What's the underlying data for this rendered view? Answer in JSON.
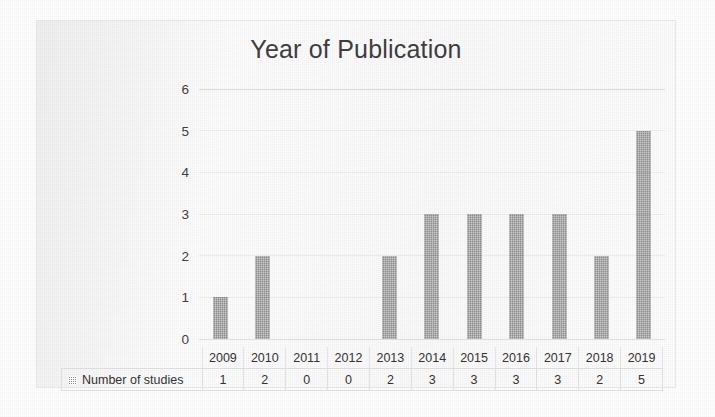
{
  "chart_data": {
    "type": "bar",
    "title": "Year of Publication",
    "xlabel": "",
    "ylabel": "",
    "categories": [
      "2009",
      "2010",
      "2011",
      "2012",
      "2013",
      "2014",
      "2015",
      "2016",
      "2017",
      "2018",
      "2019"
    ],
    "values": [
      1,
      2,
      0,
      0,
      2,
      3,
      3,
      3,
      3,
      2,
      5
    ],
    "series": [
      {
        "name": "Number of studies",
        "values": [
          1,
          2,
          0,
          0,
          2,
          3,
          3,
          3,
          3,
          2,
          5
        ]
      }
    ],
    "ylim": [
      0,
      6
    ],
    "y_ticks": [
      "6",
      "5",
      "4",
      "3",
      "2",
      "1",
      "0"
    ],
    "grid": true,
    "legend_position": "data-table-row",
    "bar_color": "#8c8c8c",
    "title_color": "#3f3f3f"
  },
  "legend": {
    "marker_icon": "hatched-square-icon",
    "label": "Number of studies"
  },
  "table": {
    "row_label": "Number of studies",
    "header": [
      "2009",
      "2010",
      "2011",
      "2012",
      "2013",
      "2014",
      "2015",
      "2016",
      "2017",
      "2018",
      "2019"
    ],
    "values": [
      "1",
      "2",
      "0",
      "0",
      "2",
      "3",
      "3",
      "3",
      "3",
      "2",
      "5"
    ]
  }
}
